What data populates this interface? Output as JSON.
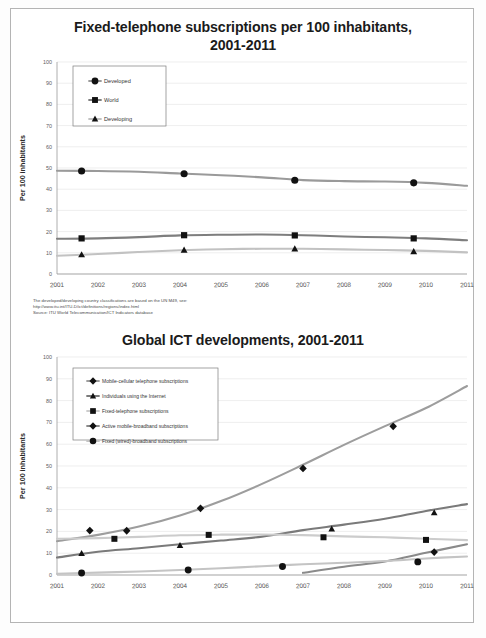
{
  "document": {
    "page_background": "#ffffff",
    "frame_border_color": "#b4b4b4"
  },
  "chart_one": {
    "title_line1": "Fixed-telephone subscriptions per 100 inhabitants,",
    "title_line2": "2001-2011",
    "ylabel": "Per 100 inhabitants",
    "footnote_line1": "The developed/developing country classifications are based on the UN M49, see:",
    "footnote_line2": "http://www.itu.int/ITU-D/ict/definitions/regions/index.html",
    "footnote_line3": "Source: ITU World Telecommunication/ICT Indicators database",
    "legend": [
      {
        "label": "Developed",
        "marker": "circle",
        "color": "#9a9a9a"
      },
      {
        "label": "World",
        "marker": "square",
        "color": "#7e7e7e"
      },
      {
        "label": "Developing",
        "marker": "triangle",
        "color": "#c2c2c2"
      }
    ]
  },
  "chart_two": {
    "title": "Global ICT developments, 2001-2011",
    "ylabel": "Per 100 inhabitants",
    "footnote_line1": "Source: ITU World Telecommunication/ICT Indicators database",
    "legend": [
      {
        "label": "Mobile-cellular telephone subscriptions",
        "marker": "diamond",
        "color": "#9d9d9d"
      },
      {
        "label": "Individuals using the Internet",
        "marker": "triangle",
        "color": "#7a7a7a"
      },
      {
        "label": "Fixed-telephone subscriptions",
        "marker": "square",
        "color": "#cccccc"
      },
      {
        "label": "Active mobile-broadband subscriptions",
        "marker": "diamond",
        "color": "#8a8a8a"
      },
      {
        "label": "Fixed (wired)-broadband subscriptions",
        "marker": "circle",
        "color": "#c4c4c4"
      }
    ]
  },
  "chart_data": [
    {
      "type": "line",
      "title": "Fixed-telephone subscriptions per 100 inhabitants, 2001-2011",
      "xlabel": "",
      "ylabel": "Per 100 inhabitants",
      "xlim": [
        2001,
        2011
      ],
      "ylim": [
        0,
        100
      ],
      "yticks": [
        0,
        10,
        20,
        30,
        40,
        50,
        60,
        70,
        80,
        90,
        100
      ],
      "xticks": [
        2001,
        2002,
        2003,
        2004,
        2005,
        2006,
        2007,
        2008,
        2009,
        2010,
        2011
      ],
      "grid": true,
      "legend_position": "upper-left",
      "x": [
        2001,
        2002,
        2003,
        2004,
        2005,
        2006,
        2007,
        2008,
        2009,
        2010,
        2011
      ],
      "series": [
        {
          "name": "Developed",
          "marker": "circle",
          "color": "#9a9a9a",
          "values": [
            48.7,
            48.6,
            48.2,
            47.4,
            46.6,
            45.6,
            44.3,
            43.8,
            43.6,
            43.0,
            41.6
          ],
          "marker_points": [
            {
              "x": 2001.6,
              "y": 48.6
            },
            {
              "x": 2004.1,
              "y": 47.3
            },
            {
              "x": 2006.8,
              "y": 44.2
            },
            {
              "x": 2009.7,
              "y": 43.0
            }
          ]
        },
        {
          "name": "World",
          "marker": "square",
          "color": "#7e7e7e",
          "values": [
            16.6,
            16.8,
            17.4,
            18.2,
            18.5,
            18.6,
            18.3,
            17.7,
            17.3,
            16.8,
            15.9
          ],
          "marker_points": [
            {
              "x": 2001.6,
              "y": 16.8
            },
            {
              "x": 2004.1,
              "y": 18.3
            },
            {
              "x": 2006.8,
              "y": 18.2
            },
            {
              "x": 2009.7,
              "y": 16.8
            }
          ]
        },
        {
          "name": "Developing",
          "marker": "triangle",
          "color": "#c2c2c2",
          "values": [
            8.6,
            9.4,
            10.4,
            11.2,
            11.7,
            11.9,
            11.9,
            11.6,
            11.3,
            10.9,
            10.2
          ],
          "marker_points": [
            {
              "x": 2001.6,
              "y": 9.1
            },
            {
              "x": 2004.1,
              "y": 11.3
            },
            {
              "x": 2006.8,
              "y": 11.9
            },
            {
              "x": 2009.7,
              "y": 10.6
            }
          ]
        }
      ]
    },
    {
      "type": "line",
      "title": "Global ICT developments, 2001-2011",
      "xlabel": "",
      "ylabel": "Per 100 inhabitants",
      "xlim": [
        2001,
        2011
      ],
      "ylim": [
        0,
        100
      ],
      "yticks": [
        0,
        10,
        20,
        30,
        40,
        50,
        60,
        70,
        80,
        90,
        100
      ],
      "xticks": [
        2001,
        2002,
        2003,
        2004,
        2005,
        2006,
        2007,
        2008,
        2009,
        2010,
        2011
      ],
      "grid": true,
      "legend_position": "upper-left",
      "x": [
        2001,
        2002,
        2003,
        2004,
        2005,
        2006,
        2007,
        2008,
        2009,
        2010,
        2011
      ],
      "series": [
        {
          "name": "Mobile-cellular telephone subscriptions",
          "marker": "diamond",
          "color": "#9d9d9d",
          "values": [
            15.5,
            18.4,
            22.2,
            27.3,
            33.9,
            41.8,
            50.6,
            59.7,
            68.3,
            76.6,
            86.7
          ],
          "marker_points": [
            {
              "x": 2001.8,
              "y": 20.4
            },
            {
              "x": 2002.7,
              "y": 20.3
            },
            {
              "x": 2004.5,
              "y": 30.6
            },
            {
              "x": 2007.0,
              "y": 48.9
            },
            {
              "x": 2009.2,
              "y": 68.2
            }
          ]
        },
        {
          "name": "Individuals using the Internet",
          "marker": "triangle",
          "color": "#7a7a7a",
          "values": [
            8.0,
            10.7,
            12.3,
            14.1,
            15.8,
            17.6,
            20.6,
            23.1,
            25.8,
            29.4,
            32.5
          ],
          "marker_points": [
            {
              "x": 2001.6,
              "y": 9.9
            },
            {
              "x": 2004.0,
              "y": 13.6
            },
            {
              "x": 2007.7,
              "y": 21.1
            },
            {
              "x": 2010.2,
              "y": 28.6
            }
          ]
        },
        {
          "name": "Fixed-telephone subscriptions",
          "marker": "square",
          "color": "#cccccc",
          "values": [
            16.6,
            16.9,
            17.5,
            18.2,
            18.5,
            18.6,
            18.3,
            17.7,
            17.3,
            16.6,
            16.0
          ],
          "marker_points": [
            {
              "x": 2002.4,
              "y": 16.6
            },
            {
              "x": 2004.7,
              "y": 18.4
            },
            {
              "x": 2007.5,
              "y": 17.3
            },
            {
              "x": 2010.0,
              "y": 16.1
            }
          ]
        },
        {
          "name": "Active mobile-broadband subscriptions",
          "marker": "diamond",
          "color": "#8a8a8a",
          "values": [
            0,
            0,
            0,
            0,
            0,
            0,
            1.0,
            3.8,
            6.2,
            10.2,
            14.1
          ],
          "marker_points": [
            {
              "x": 2010.2,
              "y": 10.5
            }
          ]
        },
        {
          "name": "Fixed (wired)-broadband subscriptions",
          "marker": "circle",
          "color": "#c4c4c4",
          "values": [
            0.6,
            1.1,
            1.6,
            2.3,
            3.1,
            4.0,
            4.9,
            5.6,
            6.4,
            7.6,
            8.5
          ],
          "marker_points": [
            {
              "x": 2001.6,
              "y": 0.9
            },
            {
              "x": 2004.2,
              "y": 2.3
            },
            {
              "x": 2006.5,
              "y": 3.9
            },
            {
              "x": 2009.8,
              "y": 6.0
            }
          ]
        }
      ]
    }
  ]
}
